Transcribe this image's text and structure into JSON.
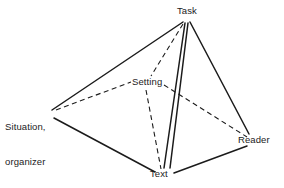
{
  "diagram": {
    "type": "node-link-diagram",
    "background_color": "#ffffff",
    "line_color": "#1b1b1b",
    "text_color": "#1b1b1b",
    "nodes": [
      {
        "id": "task",
        "label": "Task",
        "x": 186,
        "y": 22,
        "label_x": 177,
        "label_y": 5
      },
      {
        "id": "setting",
        "label": "Setting",
        "x": 148,
        "y": 85,
        "label_x": 132,
        "label_y": 76
      },
      {
        "id": "situation",
        "label_line1": "Situation,",
        "label_line2": "organizer",
        "x": 55,
        "y": 112,
        "label_x": 5,
        "label_y": 98
      },
      {
        "id": "text",
        "label": "Text",
        "x": 163,
        "y": 173,
        "label_x": 150,
        "label_y": 168
      },
      {
        "id": "reader",
        "label": "Reader",
        "x": 248,
        "y": 140,
        "label_x": 238,
        "label_y": 134
      }
    ],
    "edges": [
      {
        "from": "task",
        "to": "situation",
        "style": "solid",
        "x1": 183,
        "y1": 22,
        "x2": 52,
        "y2": 110
      },
      {
        "from": "task",
        "to": "text",
        "style": "solid",
        "x1": 185,
        "y1": 23,
        "x2": 164,
        "y2": 168
      },
      {
        "from": "task",
        "to": "text",
        "style": "solid",
        "x1": 188,
        "y1": 23,
        "x2": 170,
        "y2": 168
      },
      {
        "from": "task",
        "to": "reader",
        "style": "solid",
        "x1": 190,
        "y1": 22,
        "x2": 249,
        "y2": 134
      },
      {
        "from": "situation",
        "to": "text",
        "style": "solid",
        "x1": 54,
        "y1": 118,
        "x2": 155,
        "y2": 172
      },
      {
        "from": "text",
        "to": "reader",
        "style": "solid",
        "x1": 174,
        "y1": 173,
        "x2": 247,
        "y2": 146
      },
      {
        "from": "task",
        "to": "setting",
        "style": "dashed",
        "x1": 183,
        "y1": 24,
        "x2": 151,
        "y2": 76
      },
      {
        "from": "situation",
        "to": "setting",
        "style": "dashed",
        "x1": 56,
        "y1": 110,
        "x2": 131,
        "y2": 82
      },
      {
        "from": "setting",
        "to": "reader",
        "style": "dashed",
        "x1": 164,
        "y1": 85,
        "x2": 247,
        "y2": 137
      },
      {
        "from": "setting",
        "to": "text",
        "style": "dashed",
        "x1": 146,
        "y1": 90,
        "x2": 161,
        "y2": 169
      }
    ]
  }
}
